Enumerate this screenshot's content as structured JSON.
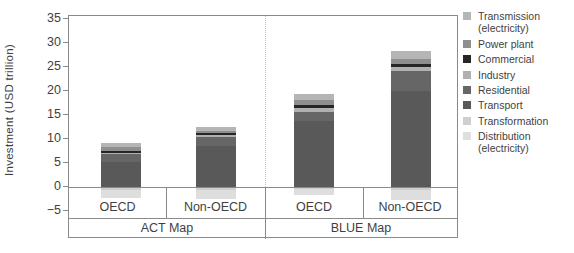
{
  "chart_data": {
    "type": "bar",
    "subtype": "stacked-bar-with-negatives",
    "title": "",
    "ylabel": "Investment (USD trillion)",
    "ylim": [
      -5,
      35
    ],
    "grid": false,
    "legend_position": "right",
    "groups": [
      "ACT Map",
      "BLUE Map"
    ],
    "categories": [
      "OECD",
      "Non-OECD",
      "OECD",
      "Non-OECD"
    ],
    "yticks": [
      {
        "v": 35,
        "label": "35"
      },
      {
        "v": 30,
        "label": "30"
      },
      {
        "v": 25,
        "label": "25"
      },
      {
        "v": 20,
        "label": "20"
      },
      {
        "v": 15,
        "label": "15"
      },
      {
        "v": 10,
        "label": "10"
      },
      {
        "v": 5,
        "label": "5"
      },
      {
        "v": 0,
        "label": "0"
      },
      {
        "v": -5,
        "label": "−5"
      }
    ],
    "series": [
      {
        "name": "Transmission (electricity)",
        "color": "#b5b5b5",
        "values": [
          0.8,
          0.8,
          1.4,
          1.6
        ]
      },
      {
        "name": "Power plant",
        "color": "#8f8f8f",
        "values": [
          0.8,
          0.4,
          1.0,
          1.0
        ]
      },
      {
        "name": "Commercial",
        "color": "#262626",
        "values": [
          0.4,
          0.5,
          0.6,
          0.6
        ]
      },
      {
        "name": "Industry",
        "color": "#b0b0b0",
        "values": [
          0.3,
          0.3,
          0.8,
          0.9
        ]
      },
      {
        "name": "Residential",
        "color": "#666666",
        "values": [
          1.6,
          2.0,
          1.9,
          4.2
        ]
      },
      {
        "name": "Transport",
        "color": "#595959",
        "values": [
          5.3,
          8.5,
          13.8,
          20.0
        ]
      },
      {
        "name": "Transformation",
        "color": "#cfcfcf",
        "values": [
          -0.4,
          -0.5,
          -0.3,
          -0.5
        ]
      },
      {
        "name": "Distribution (electricity)",
        "color": "#dedede",
        "values": [
          -1.7,
          -1.9,
          -1.2,
          -2.0
        ]
      }
    ],
    "totals_positive": [
      9.2,
      12.5,
      19.5,
      28.3
    ],
    "totals_negative": [
      -2.1,
      -2.4,
      -1.5,
      -2.5
    ],
    "frame_color": "#8a8a8a",
    "divider_style": "dotted"
  }
}
